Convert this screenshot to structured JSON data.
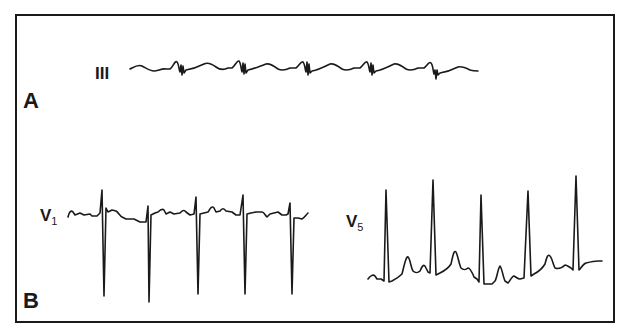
{
  "figure": {
    "panels": [
      {
        "id": "A",
        "label": "A",
        "leads": [
          {
            "name": "III",
            "main": "III",
            "subscript": ""
          }
        ]
      },
      {
        "id": "B",
        "label": "B",
        "leads": [
          {
            "name": "V1",
            "main": "V",
            "subscript": "1"
          },
          {
            "name": "V5",
            "main": "V",
            "subscript": "5"
          }
        ]
      }
    ],
    "colors": {
      "ink": "#1a1a1a",
      "background": "#ffffff"
    },
    "traces": {
      "lead_III_beats": 5,
      "lead_V1_beats": 5,
      "lead_V5_beats": 5
    }
  }
}
